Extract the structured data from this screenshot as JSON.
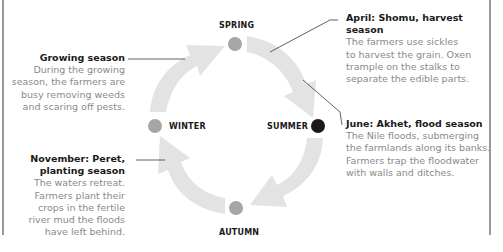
{
  "seasons": {
    "spring": {
      "label": "SPRING",
      "color": "#a6a6a6"
    },
    "summer": {
      "label": "SUMMER",
      "color": "#1a1a1a"
    },
    "autumn": {
      "label": "AUTUMN",
      "color": "#a6a6a6"
    },
    "winter": {
      "label": "WINTER",
      "color": "#a6a6a6"
    }
  },
  "notes": {
    "growing": {
      "title": "Growing season",
      "lines": [
        "During the growing",
        "season, the farmers are",
        "busy removing weeds",
        "and scaring off pests."
      ]
    },
    "april": {
      "title": "April: Shomu, harvest season",
      "lines": [
        "The farmers use sickles",
        "to harvest the grain. Oxen",
        "trample on the stalks to",
        "separate the edible parts."
      ]
    },
    "june": {
      "title": "June: Akhet, flood season",
      "lines": [
        "The Nile floods, submerging",
        "the farmlands along its banks.",
        "Farmers trap the floodwater",
        "with walls and ditches."
      ]
    },
    "november": {
      "title_lines": [
        "November: Peret,",
        "planting season"
      ],
      "lines": [
        "The waters retreat.",
        "Farmers plant their",
        "crops in the fertile",
        "river mud the floods",
        "have left behind."
      ]
    }
  },
  "colors": {
    "arrow": "#e3e3e3",
    "leader": "#3a3a3a",
    "text": "#8a8a8a",
    "heading": "#1a1a1a"
  }
}
